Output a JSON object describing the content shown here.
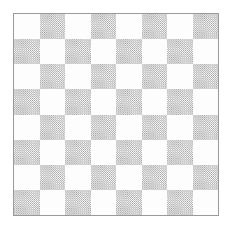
{
  "board": {
    "rows": 8,
    "columns": 8,
    "total_squares": 64,
    "light_square_count": 32,
    "dark_square_count": 32,
    "corner_top_left": "light",
    "corner_top_right": "dark",
    "corner_bottom_left": "dark",
    "corner_bottom_right": "light",
    "dark_fill_style": "diagonal-hatch",
    "hatch_angle_degrees": 45,
    "cells": [
      [
        "light",
        "dark",
        "light",
        "dark",
        "light",
        "dark",
        "light",
        "dark"
      ],
      [
        "dark",
        "light",
        "dark",
        "light",
        "dark",
        "light",
        "dark",
        "light"
      ],
      [
        "light",
        "dark",
        "light",
        "dark",
        "light",
        "dark",
        "light",
        "dark"
      ],
      [
        "dark",
        "light",
        "dark",
        "light",
        "dark",
        "light",
        "dark",
        "light"
      ],
      [
        "light",
        "dark",
        "light",
        "dark",
        "light",
        "dark",
        "light",
        "dark"
      ],
      [
        "dark",
        "light",
        "dark",
        "light",
        "dark",
        "light",
        "dark",
        "light"
      ],
      [
        "light",
        "dark",
        "light",
        "dark",
        "light",
        "dark",
        "light",
        "dark"
      ],
      [
        "dark",
        "light",
        "dark",
        "light",
        "dark",
        "light",
        "dark",
        "light"
      ]
    ]
  },
  "colors": {
    "page_background": "#ffffff",
    "light_square": "#fdfdfd",
    "dark_square_average": "#b0b0b0",
    "hatch_line": "#9d9d9d",
    "border": "#9a9a9a"
  },
  "geometry": {
    "image_width": 232,
    "image_height": 229,
    "board_left": 13,
    "board_top": 13,
    "board_width": 206,
    "board_height": 203,
    "border_width": 1
  }
}
